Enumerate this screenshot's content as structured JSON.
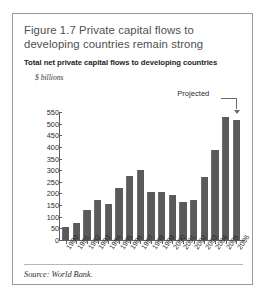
{
  "figure": {
    "title": "Figure 1.7  Private capital flows to developing countries remain strong",
    "subtitle": "Total net private capital flows to developing countries",
    "source": "Source: World Bank.",
    "annotation": "Projected",
    "y_unit": "$ billions"
  },
  "chart_data": {
    "type": "bar",
    "title": "Figure 1.7  Private capital flows to developing countries remain strong",
    "subtitle": "Total net private capital flows to developing countries",
    "xlabel": "",
    "ylabel": "$ billions",
    "ylim": [
      0,
      550
    ],
    "yticks": [
      0,
      50,
      100,
      150,
      200,
      250,
      300,
      350,
      400,
      450,
      500,
      550
    ],
    "grid": false,
    "legend": null,
    "bar_color": "#5a5a5a",
    "annotations": [
      {
        "text": "Projected",
        "points_to": "2006"
      }
    ],
    "categories": [
      "1990",
      "1991",
      "1992",
      "1993",
      "1994",
      "1995",
      "1996",
      "1997",
      "1998",
      "1999",
      "2000",
      "2001",
      "2002",
      "2003",
      "2004",
      "2005",
      "2006"
    ],
    "values": [
      57,
      72,
      128,
      170,
      155,
      225,
      275,
      300,
      205,
      205,
      195,
      165,
      170,
      270,
      385,
      530,
      515
    ]
  }
}
